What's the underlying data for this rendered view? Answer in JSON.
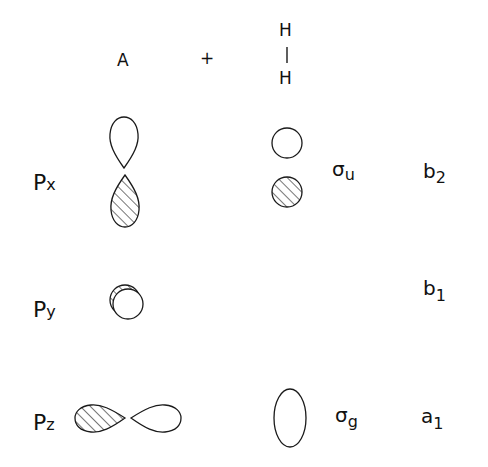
{
  "header": {
    "atom_label": "A",
    "plus_sign": "+",
    "molecule": {
      "top_atom": "H",
      "bond": "|",
      "bottom_atom": "H"
    }
  },
  "rows": [
    {
      "orbital": {
        "main": "P",
        "sub": "x"
      },
      "atom_orbital_shape": "vertical p-lobes (top open, bottom hatched)",
      "h2_orbital_shape": "two circles (top open, bottom hatched)",
      "h2_symmetry": {
        "main": "σ",
        "sub": "u"
      },
      "group_symmetry": {
        "main": "b",
        "sub": "2"
      }
    },
    {
      "orbital": {
        "main": "P",
        "sub": "y"
      },
      "atom_orbital_shape": "circle with hatched crescent (end-on p-orbital)",
      "h2_orbital_shape": "",
      "h2_symmetry": null,
      "group_symmetry": {
        "main": "b",
        "sub": "1"
      }
    },
    {
      "orbital": {
        "main": "P",
        "sub": "z"
      },
      "atom_orbital_shape": "horizontal p-lobes (left hatched, right open)",
      "h2_orbital_shape": "single open ellipse",
      "h2_symmetry": {
        "main": "σ",
        "sub": "g"
      },
      "group_symmetry": {
        "main": "a",
        "sub": "1"
      }
    }
  ],
  "colors": {
    "ink": "#1a1a1a",
    "background": "#ffffff"
  }
}
